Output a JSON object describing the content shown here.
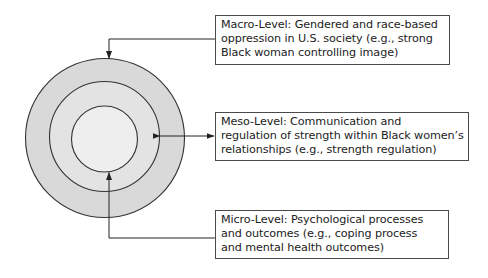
{
  "diagram": {
    "type": "concentric-levels",
    "colors": {
      "outer_ring": "#d9d9d9",
      "middle_ring": "#e3e3e3",
      "inner_circle": "#eeeeee",
      "stroke": "#333333"
    },
    "levels": [
      {
        "id": "macro",
        "title": "Macro-Level",
        "lines": [
          "Macro-Level: Gendered and race-based",
          "oppression in U.S. society (e.g., strong",
          "Black woman controlling image)"
        ],
        "points_to": "outer-circle"
      },
      {
        "id": "meso",
        "title": "Meso-Level",
        "lines": [
          "Meso-Level: Communication and",
          "regulation of strength within Black women’s",
          "relationships (e.g., strength regulation)"
        ],
        "points_to": "middle-circle"
      },
      {
        "id": "micro",
        "title": "Micro-Level",
        "lines": [
          "Micro-Level: Psychological processes",
          "and outcomes (e.g., coping process",
          "and mental health outcomes)"
        ],
        "points_to": "inner-circle"
      }
    ]
  }
}
